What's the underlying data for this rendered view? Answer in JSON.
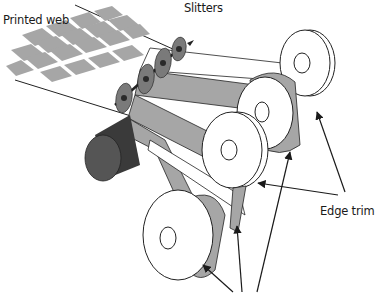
{
  "diagram": {
    "labels": {
      "printed_web": "Printed web",
      "slitters": "Slitters",
      "edge_trim": "Edge trim"
    },
    "colors": {
      "web_fill": "#ffffff",
      "label_block": "#a6a6a6",
      "slitter_disc": "#7a7a7a",
      "slitter_hub": "#2a2a2a",
      "roller": "#555555",
      "roller_dark": "#3a3a3a",
      "outline": "#222222",
      "arrow": "#1a1a1a"
    },
    "components": [
      "printed-web",
      "slitter-shaft",
      "slitter-discs",
      "idler-roller",
      "rewind-rolls",
      "edge-trim-rolls"
    ]
  }
}
